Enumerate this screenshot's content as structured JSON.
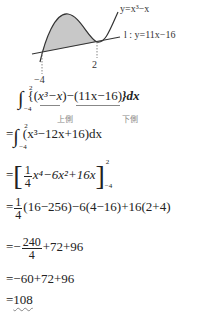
{
  "graph": {
    "curve_label": "y=x³−x",
    "line_label": "l : y=11x−16",
    "x_ticks": [
      "−4",
      "2"
    ],
    "shade_color": "#c8c8c8"
  },
  "steps": {
    "s1": {
      "int_upper": "2",
      "int_lower": "−4",
      "open": "{(",
      "upper_expr": "x³−x",
      "mid": ")−",
      "lower_expr": "(11x−16)",
      "close": "}dx",
      "upper_label": "上側",
      "lower_label": "下側"
    },
    "s2": {
      "eq": "=",
      "int_upper": "2",
      "int_lower": "−4",
      "expr": "(x³−12x+16)dx"
    },
    "s3": {
      "eq": "=",
      "frac_num": "1",
      "frac_den": "4",
      "expr": "x⁴−6x²+16x",
      "upper": "2",
      "lower": "−4"
    },
    "s4": {
      "eq": "=",
      "frac_num": "1",
      "frac_den": "4",
      "expr": "(16−256)−6(4−16)+16(2+4)"
    },
    "s5": {
      "eq": "=−",
      "frac_num": "240",
      "frac_den": "4",
      "expr": "+72+96"
    },
    "s6": {
      "text": "=−60+72+96"
    },
    "s7": {
      "eq": "=",
      "result": "108"
    }
  }
}
